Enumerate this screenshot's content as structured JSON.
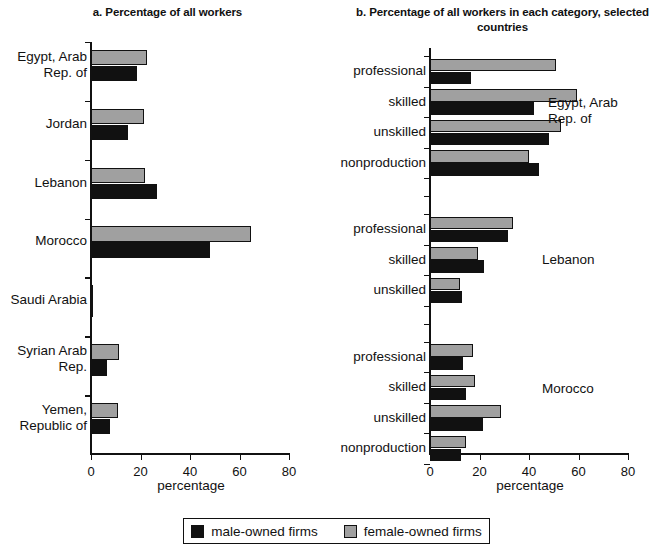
{
  "legend": {
    "items": [
      {
        "label": "male-owned firms",
        "key": "male",
        "color": "#111111"
      },
      {
        "label": "female-owned firms",
        "key": "female",
        "color": "#a0a0a0"
      }
    ]
  },
  "panel_a": {
    "title": "a. Percentage of all workers",
    "axis_title": "percentage"
  },
  "panel_b": {
    "title": "b. Percentage of all workers in each\ncategory, selected countries",
    "axis_title": "percentage"
  },
  "chart_data": [
    {
      "type": "bar",
      "orientation": "horizontal",
      "title": "a. Percentage of all workers",
      "xlabel": "percentage",
      "ylabel": "",
      "xlim": [
        0,
        80
      ],
      "xticks": [
        0,
        20,
        40,
        60,
        80
      ],
      "grid": false,
      "legend_position": "bottom-center",
      "categories": [
        "Egypt, Arab\nRep. of",
        "Jordan",
        "Lebanon",
        "Morocco",
        "Saudi Arabia",
        "Syrian Arab\nRep.",
        "Yemen,\nRepublic of"
      ],
      "series": [
        {
          "name": "female-owned firms",
          "color": "#a0a0a0",
          "values": [
            22.5,
            21.5,
            22.0,
            64.5,
            1.0,
            11.5,
            11.0
          ]
        },
        {
          "name": "male-owned firms",
          "color": "#111111",
          "values": [
            18.5,
            15.0,
            26.5,
            48.0,
            1.0,
            6.5,
            7.5
          ]
        }
      ]
    },
    {
      "type": "bar",
      "orientation": "horizontal",
      "title": "b. Percentage of all workers in each category, selected countries",
      "xlabel": "percentage",
      "ylabel": "",
      "xlim": [
        0,
        80
      ],
      "xticks": [
        0,
        20,
        40,
        60,
        80
      ],
      "grid": false,
      "legend_position": "bottom-center",
      "groups": [
        {
          "country": "Egypt, Arab\nRep. of",
          "categories": [
            "professional",
            "skilled",
            "unskilled",
            "nonproduction"
          ],
          "series": [
            {
              "name": "female-owned firms",
              "color": "#a0a0a0",
              "values": [
                51.0,
                59.5,
                53.0,
                40.0
              ]
            },
            {
              "name": "male-owned firms",
              "color": "#111111",
              "values": [
                16.5,
                42.0,
                48.0,
                44.0
              ]
            }
          ]
        },
        {
          "country": "Lebanon",
          "categories": [
            "professional",
            "skilled",
            "unskilled"
          ],
          "series": [
            {
              "name": "female-owned firms",
              "color": "#a0a0a0",
              "values": [
                33.5,
                19.5,
                12.0
              ]
            },
            {
              "name": "male-owned firms",
              "color": "#111111",
              "values": [
                31.5,
                22.0,
                13.0
              ]
            }
          ]
        },
        {
          "country": "Morocco",
          "categories": [
            "professional",
            "skilled",
            "unskilled",
            "nonproduction"
          ],
          "series": [
            {
              "name": "female-owned firms",
              "color": "#a0a0a0",
              "values": [
                17.5,
                18.0,
                28.5,
                14.5
              ]
            },
            {
              "name": "male-owned firms",
              "color": "#111111",
              "values": [
                13.5,
                14.5,
                21.5,
                12.5
              ]
            }
          ]
        }
      ]
    }
  ]
}
